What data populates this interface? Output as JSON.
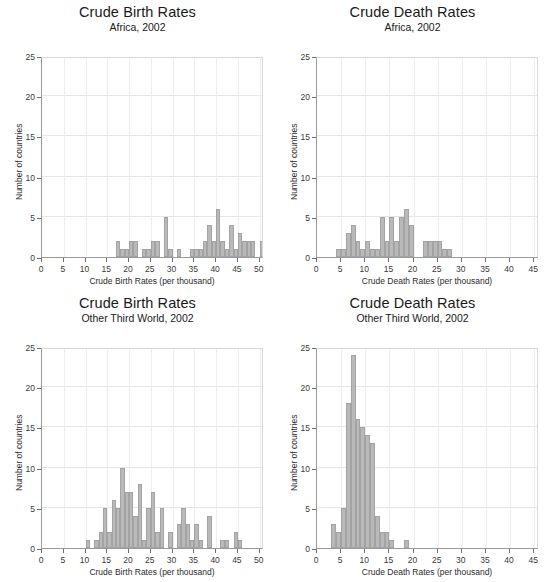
{
  "page": {
    "background": "#ffffff",
    "bar_fill": "#b9b9b9",
    "bar_stroke": "#a3a3a3",
    "grid_color": "#e6e6e6",
    "axis_color": "#9a9a9a"
  },
  "charts": [
    {
      "id": "crude-birth-rates-africa",
      "title": "Crude Birth Rates",
      "subtitle": "Africa, 2002",
      "xlabel": "Crude Birth Rates (per thousand)",
      "ylabel": "Number of countries",
      "chart_data": {
        "type": "bar",
        "title": "Crude Birth Rates",
        "subtitle": "Africa, 2002",
        "xlabel": "Crude Birth Rates (per thousand)",
        "ylabel": "Number of countries",
        "xlim": [
          0,
          51
        ],
        "ylim": [
          0,
          25
        ],
        "xticks": [
          0,
          5,
          10,
          15,
          20,
          25,
          30,
          35,
          40,
          45,
          50
        ],
        "yticks": [
          0,
          5,
          10,
          15,
          20,
          25
        ],
        "grid": true,
        "legend": "none",
        "bin_width": 1,
        "bin_starts": [
          17,
          18,
          19,
          20,
          21,
          23,
          24,
          25,
          26,
          28,
          29,
          31,
          34,
          35,
          36,
          37,
          38,
          39,
          40,
          41,
          42,
          43,
          44,
          45,
          46,
          47,
          48,
          50
        ],
        "values": [
          2,
          1,
          1,
          2,
          2,
          1,
          1,
          2,
          2,
          5,
          1,
          1,
          1,
          1,
          1,
          2,
          4,
          2,
          6,
          2,
          1,
          4,
          1,
          3,
          2,
          2,
          2,
          2
        ]
      }
    },
    {
      "id": "crude-death-rates-africa",
      "title": "Crude Death Rates",
      "subtitle": "Africa, 2002",
      "xlabel": "Crude Death Rates (per thousand)",
      "ylabel": "Number of countries",
      "chart_data": {
        "type": "bar",
        "title": "Crude Death Rates",
        "subtitle": "Africa, 2002",
        "xlabel": "Crude Death Rates (per thousand)",
        "ylabel": "Number of countries",
        "xlim": [
          0,
          46
        ],
        "ylim": [
          0,
          25
        ],
        "xticks": [
          0,
          5,
          10,
          15,
          20,
          25,
          30,
          35,
          40,
          45
        ],
        "yticks": [
          0,
          5,
          10,
          15,
          20,
          25
        ],
        "grid": true,
        "legend": "none",
        "bin_width": 1,
        "bin_starts": [
          4,
          5,
          6,
          7,
          8,
          9,
          10,
          11,
          12,
          13,
          14,
          15,
          16,
          17,
          18,
          19,
          22,
          23,
          24,
          25,
          26,
          27
        ],
        "values": [
          1,
          1,
          3,
          4,
          2,
          1,
          2,
          1,
          1,
          5,
          2,
          5,
          2,
          5,
          6,
          4,
          2,
          2,
          2,
          2,
          1,
          1
        ]
      }
    },
    {
      "id": "crude-birth-rates-other-third-world",
      "title": "Crude Birth Rates",
      "subtitle": "Other Third World, 2002",
      "xlabel": "Crude Birth Rates (per thousand)",
      "ylabel": "Number of countries",
      "chart_data": {
        "type": "bar",
        "title": "Crude Birth Rates",
        "subtitle": "Other Third World, 2002",
        "xlabel": "Crude Birth Rates (per thousand)",
        "ylabel": "Number of countries",
        "xlim": [
          0,
          51
        ],
        "ylim": [
          0,
          25
        ],
        "xticks": [
          0,
          5,
          10,
          15,
          20,
          25,
          30,
          35,
          40,
          45,
          50
        ],
        "yticks": [
          0,
          5,
          10,
          15,
          20,
          25
        ],
        "grid": true,
        "legend": "none",
        "bin_width": 1,
        "bin_starts": [
          10,
          12,
          13,
          14,
          15,
          16,
          17,
          18,
          19,
          20,
          21,
          22,
          23,
          24,
          25,
          26,
          27,
          29,
          31,
          32,
          33,
          34,
          35,
          36,
          38,
          41,
          42,
          44,
          45
        ],
        "values": [
          1,
          1,
          2,
          5,
          2,
          6,
          5,
          10,
          7,
          7,
          4,
          8,
          1,
          5,
          7,
          2,
          5,
          2,
          3,
          5,
          3,
          1,
          3,
          1,
          4,
          1,
          1,
          2,
          1
        ]
      }
    },
    {
      "id": "crude-death-rates-other-third-world",
      "title": "Crude Death Rates",
      "subtitle": "Other Third World, 2002",
      "xlabel": "Crude Death Rates (per thousand)",
      "ylabel": "Number of countries",
      "chart_data": {
        "type": "bar",
        "title": "Crude Death Rates",
        "subtitle": "Other Third World, 2002",
        "xlabel": "Crude Death Rates (per thousand)",
        "ylabel": "Number of countries",
        "xlim": [
          0,
          46
        ],
        "ylim": [
          0,
          25
        ],
        "xticks": [
          0,
          5,
          10,
          15,
          20,
          25,
          30,
          35,
          40,
          45
        ],
        "yticks": [
          0,
          5,
          10,
          15,
          20,
          25
        ],
        "grid": true,
        "legend": "none",
        "bin_width": 1,
        "bin_starts": [
          3,
          4,
          5,
          6,
          7,
          8,
          9,
          10,
          11,
          12,
          13,
          14,
          15,
          18
        ],
        "values": [
          3,
          2,
          5,
          18,
          24,
          16,
          15,
          14,
          13,
          4,
          2,
          2,
          1,
          1
        ]
      }
    }
  ]
}
